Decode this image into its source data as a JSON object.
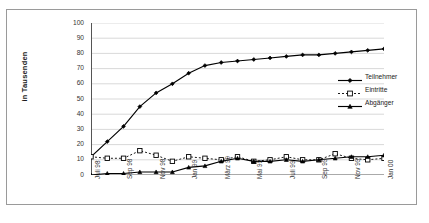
{
  "chart_data": {
    "type": "line",
    "title": "",
    "xlabel": "",
    "ylabel": "in Tausenden",
    "ylim": [
      0,
      100
    ],
    "ytick_step": 10,
    "yticks": [
      0,
      10,
      20,
      30,
      40,
      50,
      60,
      70,
      80,
      90,
      100
    ],
    "grid": true,
    "grid_axis": "y",
    "legend_position": "right",
    "x_tick_labels": [
      "Juli 98",
      "Sep 98",
      "Nov 98",
      "Jan 99",
      "März 99",
      "Mai 99",
      "Juli 99",
      "Sep 99",
      "Nov 99",
      "Jan 00"
    ],
    "x": [
      "Juli 98",
      "Aug 98",
      "Sep 98",
      "Okt 98",
      "Nov 98",
      "Dez 98",
      "Jan 99",
      "Feb 99",
      "März 99",
      "Apr 99",
      "Mai 99",
      "Juni 99",
      "Juli 99",
      "Aug 99",
      "Sep 99",
      "Okt 99",
      "Nov 99",
      "Dez 99",
      "Jan 00"
    ],
    "series": [
      {
        "name": "Teilnehmer",
        "marker": "diamond",
        "line_style": "solid",
        "color": "#000000",
        "values": [
          12,
          22,
          32,
          45,
          54,
          60,
          67,
          72,
          74,
          75,
          76,
          77,
          78,
          79,
          79,
          80,
          81,
          82,
          83
        ]
      },
      {
        "name": "Eintritte",
        "marker": "square",
        "line_style": "dashed",
        "color": "#000000",
        "values": [
          12,
          11,
          11,
          16,
          13,
          9,
          12,
          11,
          10,
          12,
          9,
          10,
          12,
          10,
          10,
          14,
          11,
          10,
          11
        ]
      },
      {
        "name": "Abgänger",
        "marker": "triangle",
        "line_style": "solid",
        "color": "#000000",
        "values": [
          0,
          1,
          1,
          2,
          2,
          2,
          5,
          6,
          9,
          11,
          9,
          9,
          10,
          9,
          10,
          11,
          12,
          12,
          13
        ]
      }
    ]
  },
  "legend": {
    "items": [
      {
        "label": "Teilnehmer"
      },
      {
        "label": "Eintritte"
      },
      {
        "label": "Abgänger"
      }
    ]
  },
  "colors": {
    "axis": "#555555",
    "grid": "#c8c8c8",
    "series": "#000000",
    "frame": "#9a9a9a"
  }
}
